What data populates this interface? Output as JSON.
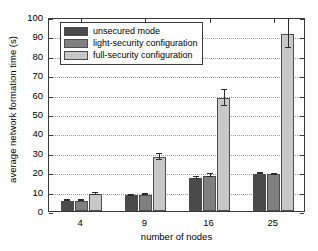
{
  "chart_data": {
    "type": "bar",
    "title": "",
    "xlabel": "number of nodes",
    "ylabel": "average network formation time (s)",
    "categories": [
      "4",
      "9",
      "16",
      "25"
    ],
    "ylim": [
      0,
      100
    ],
    "yticks": [
      0,
      10,
      20,
      30,
      40,
      50,
      60,
      70,
      80,
      90,
      100
    ],
    "ytick_labels": [
      "0",
      "10",
      "20",
      "30",
      "40",
      "50",
      "60",
      "70",
      "80",
      "90",
      "100"
    ],
    "grid": true,
    "legend_position": "top-left",
    "series": [
      {
        "name": "unsecured mode",
        "color": "#4a4a4a",
        "values": [
          5.3,
          8.0,
          17.0,
          19.3
        ],
        "err_low": [
          5.0,
          7.8,
          16.7,
          19.0
        ],
        "err_high": [
          5.6,
          8.3,
          17.4,
          19.6
        ]
      },
      {
        "name": "light-security configuration",
        "color": "#808080",
        "values": [
          5.3,
          8.5,
          18.3,
          18.9
        ],
        "err_low": [
          5.0,
          8.2,
          17.3,
          18.6
        ],
        "err_high": [
          5.6,
          8.8,
          19.3,
          19.2
        ]
      },
      {
        "name": "full-security configuration",
        "color": "#c8c8c8",
        "values": [
          8.8,
          27.8,
          58.2,
          91.3
        ],
        "err_low": [
          8.5,
          26.3,
          54.2,
          83.8
        ],
        "err_high": [
          9.1,
          29.4,
          62.2,
          98.9
        ]
      }
    ]
  },
  "legend": {
    "entries": [
      "unsecured mode",
      "light-security configuration",
      "full-security configuration"
    ]
  },
  "colors": {
    "unsecured": "#4a4a4a",
    "light_security": "#808080",
    "full_security": "#c8c8c8",
    "axis": "#3a3a3a",
    "grid": "#9a9a9a",
    "background": "#ffffff"
  }
}
